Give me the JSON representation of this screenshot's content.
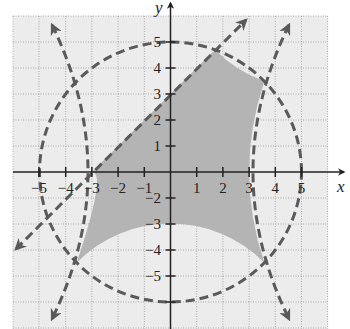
{
  "figure": {
    "type": "graph of a system of inequalities",
    "x_axis_label": "x",
    "y_axis_label": "y",
    "x_ticks": [
      "−5",
      "−4",
      "−3",
      "−2",
      "−1",
      "1",
      "2",
      "3",
      "4",
      "5"
    ],
    "y_ticks": [
      "5",
      "4",
      "3",
      "2",
      "1",
      "−2",
      "−3",
      "−4",
      "−5"
    ],
    "grid_range": {
      "x": [
        -6,
        6
      ],
      "y": [
        -6,
        6
      ]
    },
    "boundaries": [
      {
        "name": "circle",
        "equation": "x^2 + y^2 = 25",
        "style": "dashed"
      },
      {
        "name": "line",
        "equation": "y = x + 3",
        "style": "dashed, arrows"
      },
      {
        "name": "right-parabola",
        "equation": "x = 3 + y^2/21 (approx)",
        "style": "dashed, arrows"
      },
      {
        "name": "left-parabola",
        "equation": "x = -3 - y^2/21 (approx)",
        "style": "dashed, arrows"
      }
    ],
    "colors": {
      "solution_region": "#b4b4b4",
      "light_shading": "#ececec",
      "curve_stroke": "#5a5a5a",
      "axis": "#222222",
      "grid": "#9a9a9a"
    }
  }
}
